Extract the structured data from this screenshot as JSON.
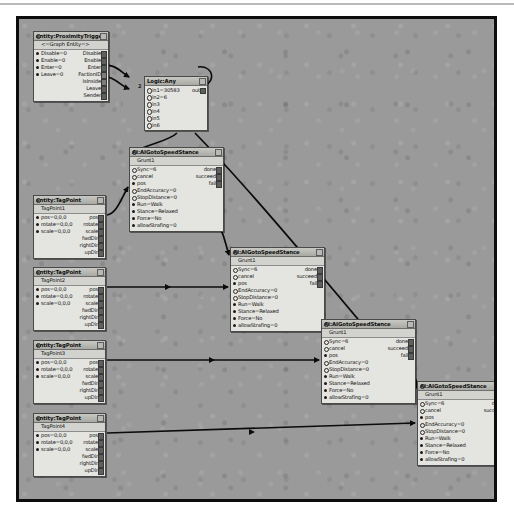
{
  "app": {
    "type": "flowgraph-editor",
    "canvas_background": "#9a9a9a",
    "node_background": "#e4e4e0",
    "node_border": "#4a4a4a"
  },
  "wire_labels": [
    {
      "text": "2",
      "x": 119,
      "y": 64
    }
  ],
  "nodes": [
    {
      "id": "proximity-trigger",
      "title": "entity:ProximityTrigger",
      "subtitle": "<=Graph Entity=>",
      "x": 14,
      "y": 12,
      "width": 76,
      "rows": [
        {
          "in": "Disable=0",
          "in_kind": "dot",
          "out": "Disable",
          "out_lit": true
        },
        {
          "in": "Enable=0",
          "in_kind": "dot",
          "out": "Enable",
          "out_lit": true
        },
        {
          "in": "Enter=0",
          "in_kind": "dot",
          "out": "Enter",
          "out_lit": true
        },
        {
          "in": "Leave=0",
          "in_kind": "dot",
          "out": "FactionID",
          "out_lit": false
        },
        {
          "in": "",
          "in_kind": "none",
          "out": "IsInside",
          "out_lit": false
        },
        {
          "in": "",
          "in_kind": "none",
          "out": "Leave",
          "out_lit": true
        },
        {
          "in": "",
          "in_kind": "none",
          "out": "Sender",
          "out_lit": true
        }
      ]
    },
    {
      "id": "logic-any",
      "title": "Logic:Any",
      "subtitle": "",
      "x": 125,
      "y": 57,
      "width": 64,
      "rows": [
        {
          "in": "in1=30583",
          "in_kind": "circ",
          "out": "out",
          "out_lit": true
        },
        {
          "in": "in2=6",
          "in_kind": "circ",
          "out": "",
          "out_lit": false
        },
        {
          "in": "in3",
          "in_kind": "circ",
          "out": "",
          "out_lit": false
        },
        {
          "in": "in4",
          "in_kind": "circ",
          "out": "",
          "out_lit": false
        },
        {
          "in": "in5",
          "in_kind": "circ",
          "out": "",
          "out_lit": false
        },
        {
          "in": "in6",
          "in_kind": "circ",
          "out": "",
          "out_lit": false
        }
      ]
    },
    {
      "id": "ai-goto-1",
      "title": "AI:AIGotoSpeedStance",
      "subtitle": "Grunt1",
      "x": 110,
      "y": 128,
      "width": 95,
      "rows": [
        {
          "in": "Sync=6",
          "in_kind": "circ",
          "out": "done",
          "out_lit": true
        },
        {
          "in": "cancel",
          "in_kind": "circ",
          "out": "succeed",
          "out_lit": true
        },
        {
          "in": "pos",
          "in_kind": "dot",
          "out": "fail",
          "out_lit": true
        },
        {
          "in": "EndAccuracy=0",
          "in_kind": "circ",
          "out": "",
          "out_lit": false
        },
        {
          "in": "StopDistance=0",
          "in_kind": "circ",
          "out": "",
          "out_lit": false
        },
        {
          "in": "Run=Walk",
          "in_kind": "dot",
          "out": "",
          "out_lit": false
        },
        {
          "in": "Stance=Relaxed",
          "in_kind": "dot",
          "out": "",
          "out_lit": false
        },
        {
          "in": "Force=No",
          "in_kind": "dot",
          "out": "",
          "out_lit": false
        },
        {
          "in": "allowStrafing=0",
          "in_kind": "dot",
          "out": "",
          "out_lit": false
        }
      ]
    },
    {
      "id": "ai-goto-2",
      "title": "AI:AIGotoSpeedStance",
      "subtitle": "Grunt1",
      "x": 211,
      "y": 228,
      "width": 95,
      "rows": [
        {
          "in": "Sync=6",
          "in_kind": "circ",
          "out": "done",
          "out_lit": true
        },
        {
          "in": "cancel",
          "in_kind": "circ",
          "out": "succeed",
          "out_lit": true
        },
        {
          "in": "pos",
          "in_kind": "dot",
          "out": "fail",
          "out_lit": true
        },
        {
          "in": "EndAccuracy=0",
          "in_kind": "circ",
          "out": "",
          "out_lit": false
        },
        {
          "in": "StopDistance=0",
          "in_kind": "circ",
          "out": "",
          "out_lit": false
        },
        {
          "in": "Run=Walk",
          "in_kind": "dot",
          "out": "",
          "out_lit": false
        },
        {
          "in": "Stance=Relaxed",
          "in_kind": "dot",
          "out": "",
          "out_lit": false
        },
        {
          "in": "Force=No",
          "in_kind": "dot",
          "out": "",
          "out_lit": false
        },
        {
          "in": "allowStrafing=0",
          "in_kind": "dot",
          "out": "",
          "out_lit": false
        }
      ]
    },
    {
      "id": "ai-goto-3",
      "title": "AI:AIGotoSpeedStance",
      "subtitle": "Grunt1",
      "x": 302,
      "y": 300,
      "width": 95,
      "rows": [
        {
          "in": "Sync=6",
          "in_kind": "circ",
          "out": "done",
          "out_lit": true
        },
        {
          "in": "cancel",
          "in_kind": "circ",
          "out": "succeed",
          "out_lit": true
        },
        {
          "in": "pos",
          "in_kind": "dot",
          "out": "fail",
          "out_lit": true
        },
        {
          "in": "EndAccuracy=0",
          "in_kind": "circ",
          "out": "",
          "out_lit": false
        },
        {
          "in": "StopDistance=0",
          "in_kind": "circ",
          "out": "",
          "out_lit": false
        },
        {
          "in": "Run=Walk",
          "in_kind": "dot",
          "out": "",
          "out_lit": false
        },
        {
          "in": "Stance=Relaxed",
          "in_kind": "dot",
          "out": "",
          "out_lit": false
        },
        {
          "in": "Force=No",
          "in_kind": "dot",
          "out": "",
          "out_lit": false
        },
        {
          "in": "allowStrafing=0",
          "in_kind": "dot",
          "out": "",
          "out_lit": false
        }
      ]
    },
    {
      "id": "ai-goto-4",
      "title": "AI:AIGotoSpeedStance",
      "subtitle": "Grunt1",
      "x": 398,
      "y": 362,
      "width": 95,
      "rows": [
        {
          "in": "Sync=6",
          "in_kind": "circ",
          "out": "done",
          "out_lit": true
        },
        {
          "in": "cancel",
          "in_kind": "circ",
          "out": "succeed",
          "out_lit": true
        },
        {
          "in": "pos",
          "in_kind": "dot",
          "out": "fail",
          "out_lit": true
        },
        {
          "in": "EndAccuracy=0",
          "in_kind": "circ",
          "out": "",
          "out_lit": false
        },
        {
          "in": "StopDistance=0",
          "in_kind": "circ",
          "out": "",
          "out_lit": false
        },
        {
          "in": "Run=Walk",
          "in_kind": "dot",
          "out": "",
          "out_lit": false
        },
        {
          "in": "Stance=Relaxed",
          "in_kind": "dot",
          "out": "",
          "out_lit": false
        },
        {
          "in": "Force=No",
          "in_kind": "dot",
          "out": "",
          "out_lit": false
        },
        {
          "in": "allowStrafing=0",
          "in_kind": "dot",
          "out": "",
          "out_lit": false
        }
      ]
    },
    {
      "id": "tagpoint-1",
      "title": "entity:TagPoint",
      "subtitle": "TagPoint1",
      "x": 14,
      "y": 176,
      "width": 73,
      "rows": [
        {
          "in": "pos=0,0,0",
          "in_kind": "dot",
          "out": "pos",
          "out_lit": true
        },
        {
          "in": "rotate=0,0,0",
          "in_kind": "dot",
          "out": "rotate",
          "out_lit": true
        },
        {
          "in": "scale=0,0,0",
          "in_kind": "dot",
          "out": "scale",
          "out_lit": true
        },
        {
          "in": "",
          "in_kind": "none",
          "out": "fwdDir",
          "out_lit": true
        },
        {
          "in": "",
          "in_kind": "none",
          "out": "rightDir",
          "out_lit": true
        },
        {
          "in": "",
          "in_kind": "none",
          "out": "upDir",
          "out_lit": true
        }
      ]
    },
    {
      "id": "tagpoint-2",
      "title": "entity:TagPoint",
      "subtitle": "TagPoint2",
      "x": 14,
      "y": 248,
      "width": 73,
      "rows": [
        {
          "in": "pos=0,0,0",
          "in_kind": "dot",
          "out": "pos",
          "out_lit": true
        },
        {
          "in": "rotate=0,0,0",
          "in_kind": "dot",
          "out": "rotate",
          "out_lit": true
        },
        {
          "in": "scale=0,0,0",
          "in_kind": "dot",
          "out": "scale",
          "out_lit": true
        },
        {
          "in": "",
          "in_kind": "none",
          "out": "fwdDir",
          "out_lit": true
        },
        {
          "in": "",
          "in_kind": "none",
          "out": "rightDir",
          "out_lit": true
        },
        {
          "in": "",
          "in_kind": "none",
          "out": "upDir",
          "out_lit": true
        }
      ]
    },
    {
      "id": "tagpoint-3",
      "title": "entity:TagPoint",
      "subtitle": "TagPoint3",
      "x": 14,
      "y": 321,
      "width": 73,
      "rows": [
        {
          "in": "pos=0,0,0",
          "in_kind": "dot",
          "out": "pos",
          "out_lit": true
        },
        {
          "in": "rotate=0,0,0",
          "in_kind": "dot",
          "out": "rotate",
          "out_lit": true
        },
        {
          "in": "scale=0,0,0",
          "in_kind": "dot",
          "out": "scale",
          "out_lit": true
        },
        {
          "in": "",
          "in_kind": "none",
          "out": "fwdDir",
          "out_lit": true
        },
        {
          "in": "",
          "in_kind": "none",
          "out": "rightDir",
          "out_lit": true
        },
        {
          "in": "",
          "in_kind": "none",
          "out": "upDir",
          "out_lit": true
        }
      ]
    },
    {
      "id": "tagpoint-4",
      "title": "entity:TagPoint",
      "subtitle": "TagPoint4",
      "x": 14,
      "y": 394,
      "width": 73,
      "rows": [
        {
          "in": "pos=0,0,0",
          "in_kind": "dot",
          "out": "pos",
          "out_lit": true
        },
        {
          "in": "rotate=0,0,0",
          "in_kind": "dot",
          "out": "rotate",
          "out_lit": true
        },
        {
          "in": "scale=0,0,0",
          "in_kind": "dot",
          "out": "scale",
          "out_lit": true
        },
        {
          "in": "",
          "in_kind": "none",
          "out": "fwdDir",
          "out_lit": true
        },
        {
          "in": "",
          "in_kind": "none",
          "out": "rightDir",
          "out_lit": true
        },
        {
          "in": "",
          "in_kind": "none",
          "out": "upDir",
          "out_lit": true
        }
      ]
    }
  ]
}
